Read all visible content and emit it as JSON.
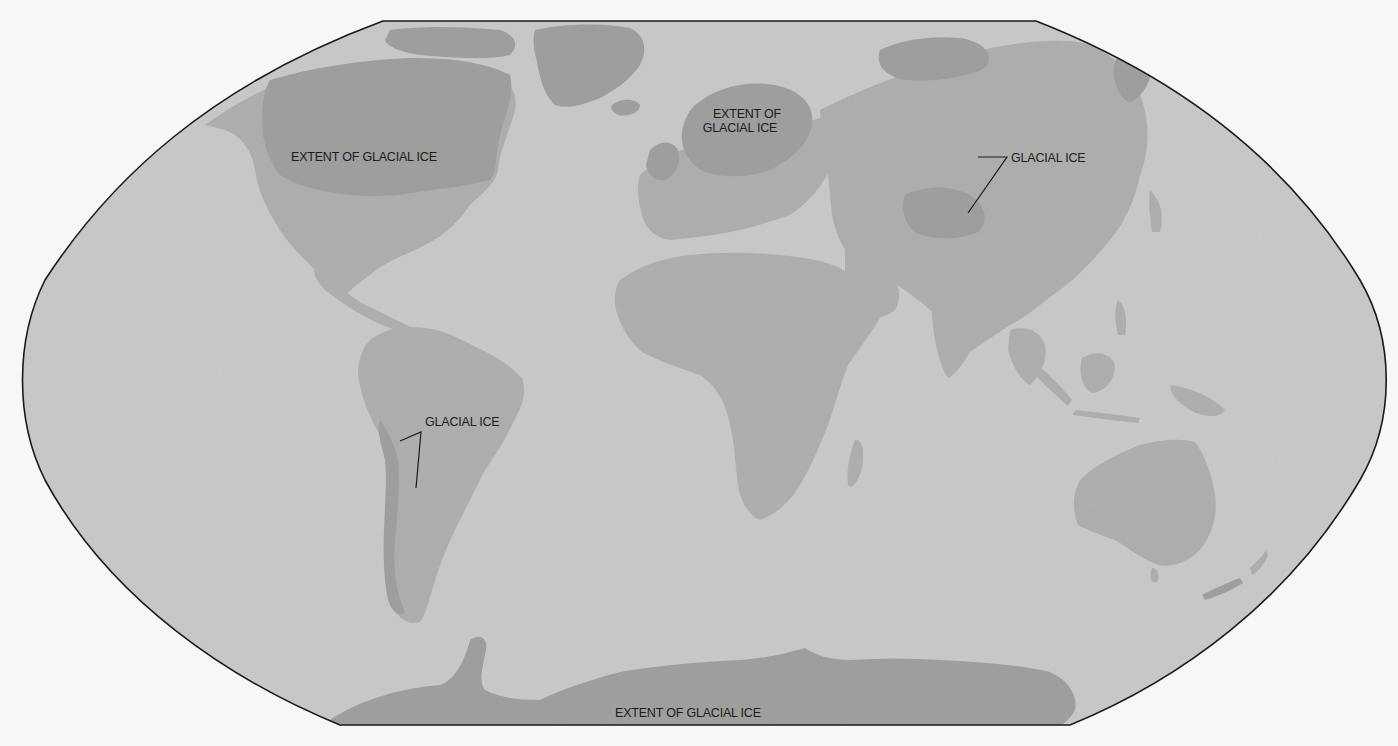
{
  "map": {
    "projection": "Winkel-style world map",
    "colors": {
      "background": "#f7f7f5",
      "ocean": "#c8c8c6",
      "land": "#adadab",
      "glacial_ice": "#9d9d9b",
      "outline": "#1a1a1a",
      "label_text": "#1c1c1c",
      "leader_line": "#1a1a1a"
    }
  },
  "labels": {
    "north_america": "EXTENT OF GLACIAL ICE",
    "europe_line1": "EXTENT OF",
    "europe_line2": "GLACIAL ICE",
    "asia": "GLACIAL ICE",
    "south_america": "GLACIAL ICE",
    "antarctica": "EXTENT OF GLACIAL ICE"
  }
}
